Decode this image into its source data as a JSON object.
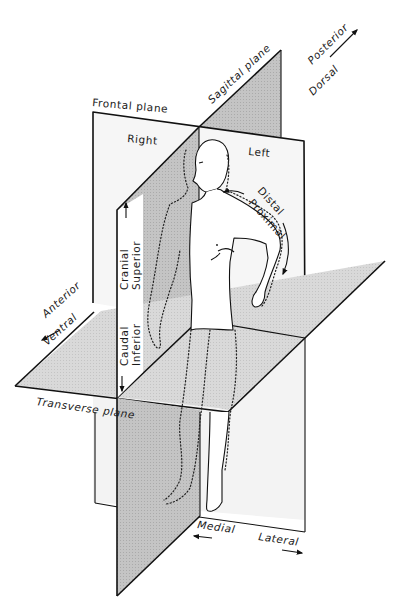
{
  "figure": {
    "planes": {
      "frontal": "Frontal plane",
      "sagittal": "Sagittal plane",
      "transverse": "Transverse plane"
    },
    "sides": {
      "right": "Right",
      "left": "Left"
    },
    "directions": {
      "posterior": "Posterior",
      "dorsal": "Dorsal",
      "anterior": "Anterior",
      "ventral": "Ventral",
      "cranial": "Cranial",
      "superior": "Superior",
      "caudal": "Caudal",
      "inferior": "Inferior",
      "distal": "Distal",
      "proximal": "Proximal",
      "medial": "Medial",
      "lateral": "Lateral"
    },
    "colors": {
      "plane_fill": "#f4f4f4",
      "sagittal_shade": "#c9c9c9",
      "transverse_shade": "#d6d6d6",
      "line": "#111111"
    }
  }
}
